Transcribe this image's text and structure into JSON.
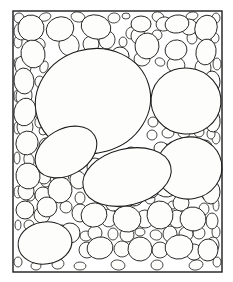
{
  "figure": {
    "kind": "sediment-thin-section",
    "colors": {
      "background": "#ffffff",
      "grain_fill": "#fdfdfc",
      "grain_outline": "#1a1a1a",
      "frame_stroke": "#1c1c1c"
    },
    "frame": {
      "x": 13,
      "y": 11,
      "width": 209,
      "height": 261,
      "stroke_width": 1.4
    },
    "canvas": {
      "width": 233,
      "height": 282
    }
  },
  "chart_data": {
    "type": "scatter",
    "xlabel": "",
    "ylabel": "",
    "xlim": [
      13,
      222
    ],
    "ylim": [
      11,
      272
    ],
    "grid": false,
    "legend": null,
    "size_classes": [
      "large",
      "medium",
      "small",
      "fine"
    ],
    "grain_counts": {
      "large": 6,
      "medium": 34,
      "small": 92,
      "fine": 74,
      "total": 206
    },
    "grains_large": [
      {
        "cx": 93,
        "cy": 101,
        "rx": 58,
        "ry": 52,
        "rot": -16,
        "class": "large"
      },
      {
        "cx": 186,
        "cy": 101,
        "rx": 35,
        "ry": 33,
        "rot": 6,
        "class": "large"
      },
      {
        "cx": 189,
        "cy": 168,
        "rx": 33,
        "ry": 31,
        "rot": -10,
        "class": "large"
      },
      {
        "cx": 127,
        "cy": 177,
        "rx": 45,
        "ry": 28,
        "rot": -14,
        "class": "large"
      },
      {
        "cx": 66,
        "cy": 152,
        "rx": 33,
        "ry": 23,
        "rot": -30,
        "class": "large"
      },
      {
        "cx": 45,
        "cy": 243,
        "rx": 27,
        "ry": 21,
        "rot": -8,
        "class": "large"
      }
    ],
    "grains_medium": [
      {
        "cx": 31,
        "cy": 28,
        "rx": 13,
        "ry": 13,
        "rot": 10
      },
      {
        "cx": 60,
        "cy": 29,
        "rx": 14,
        "ry": 12,
        "rot": -20
      },
      {
        "cx": 96,
        "cy": 27,
        "rx": 15,
        "ry": 12,
        "rot": 15
      },
      {
        "cx": 141,
        "cy": 24,
        "rx": 10,
        "ry": 8,
        "rot": 0
      },
      {
        "cx": 177,
        "cy": 24,
        "rx": 12,
        "ry": 9,
        "rot": -10
      },
      {
        "cx": 206,
        "cy": 28,
        "rx": 11,
        "ry": 13,
        "rot": 20
      },
      {
        "cx": 33,
        "cy": 54,
        "rx": 12,
        "ry": 14,
        "rot": -10
      },
      {
        "cx": 147,
        "cy": 46,
        "rx": 12,
        "ry": 13,
        "rot": 5
      },
      {
        "cx": 176,
        "cy": 50,
        "rx": 11,
        "ry": 10,
        "rot": -15
      },
      {
        "cx": 206,
        "cy": 52,
        "rx": 10,
        "ry": 13,
        "rot": 10
      },
      {
        "cx": 24,
        "cy": 81,
        "rx": 10,
        "ry": 13,
        "rot": -5
      },
      {
        "cx": 25,
        "cy": 112,
        "rx": 11,
        "ry": 14,
        "rot": 12
      },
      {
        "cx": 212,
        "cy": 82,
        "rx": 8,
        "ry": 11,
        "rot": 0
      },
      {
        "cx": 212,
        "cy": 120,
        "rx": 8,
        "ry": 12,
        "rot": -8
      },
      {
        "cx": 27,
        "cy": 143,
        "rx": 11,
        "ry": 12,
        "rot": 18
      },
      {
        "cx": 28,
        "cy": 176,
        "rx": 12,
        "ry": 13,
        "rot": -12
      },
      {
        "cx": 60,
        "cy": 190,
        "rx": 12,
        "ry": 13,
        "rot": 8
      },
      {
        "cx": 94,
        "cy": 215,
        "rx": 13,
        "ry": 12,
        "rot": -18
      },
      {
        "cx": 127,
        "cy": 219,
        "rx": 14,
        "ry": 13,
        "rot": 14
      },
      {
        "cx": 160,
        "cy": 215,
        "rx": 13,
        "ry": 14,
        "rot": -6
      },
      {
        "cx": 193,
        "cy": 219,
        "rx": 13,
        "ry": 12,
        "rot": 10
      },
      {
        "cx": 211,
        "cy": 192,
        "rx": 9,
        "ry": 12,
        "rot": 0
      },
      {
        "cx": 100,
        "cy": 248,
        "rx": 13,
        "ry": 11,
        "rot": -10
      },
      {
        "cx": 140,
        "cy": 249,
        "rx": 12,
        "ry": 12,
        "rot": 16
      },
      {
        "cx": 179,
        "cy": 247,
        "rx": 14,
        "ry": 12,
        "rot": -12
      },
      {
        "cx": 208,
        "cy": 250,
        "rx": 10,
        "ry": 11,
        "rot": 5
      },
      {
        "cx": 120,
        "cy": 56,
        "rx": 9,
        "ry": 9,
        "rot": 0
      },
      {
        "cx": 96,
        "cy": 186,
        "rx": 11,
        "ry": 10,
        "rot": -20
      },
      {
        "cx": 47,
        "cy": 207,
        "rx": 10,
        "ry": 10,
        "rot": 8
      },
      {
        "cx": 70,
        "cy": 233,
        "rx": 10,
        "ry": 10,
        "rot": -5
      },
      {
        "cx": 166,
        "cy": 186,
        "rx": 12,
        "ry": 11,
        "rot": 12
      },
      {
        "cx": 134,
        "cy": 196,
        "rx": 10,
        "ry": 10,
        "rot": -14
      },
      {
        "cx": 205,
        "cy": 150,
        "rx": 8,
        "ry": 10,
        "rot": 0
      },
      {
        "cx": 25,
        "cy": 210,
        "rx": 9,
        "ry": 9,
        "rot": 0
      }
    ]
  }
}
